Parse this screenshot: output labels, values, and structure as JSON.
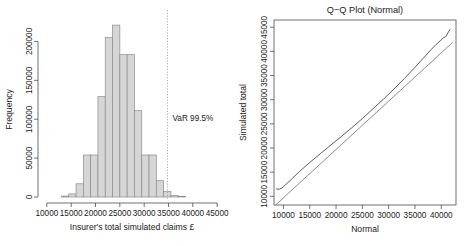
{
  "figure": {
    "background": "#ffffff",
    "panels": [
      "histogram",
      "qq-plot"
    ]
  },
  "chart_data": [
    {
      "type": "bar",
      "id": "histogram",
      "title": "",
      "xlabel": "Insurer's total simulated claims £",
      "ylabel": "Frequency",
      "xlim": [
        9000,
        46000
      ],
      "ylim": [
        0,
        225000
      ],
      "xticks": [
        10000,
        15000,
        20000,
        25000,
        30000,
        35000,
        40000,
        45000
      ],
      "xtick_labels": [
        "10000",
        "15000",
        "20000",
        "25000",
        "30000",
        "35000",
        "40000",
        "45000"
      ],
      "yticks": [
        0,
        50000,
        100000,
        150000,
        200000
      ],
      "ytick_labels": [
        "0",
        "50000",
        "100000",
        "150000",
        "200000"
      ],
      "grid": false,
      "legend": null,
      "bin_width": 1500,
      "bin_starts": [
        13000,
        14500,
        16000,
        17500,
        19000,
        20500,
        22000,
        23500,
        25000,
        26500,
        28000,
        29500,
        31000,
        32500,
        34000,
        35500,
        37000
      ],
      "values": [
        1200,
        4000,
        17000,
        54000,
        54000,
        129000,
        205000,
        221000,
        183000,
        183000,
        111000,
        54000,
        54000,
        21000,
        7000,
        1800,
        600
      ],
      "bars_fill": "#d6d6d6",
      "bars_edge": "#8c8c8c",
      "annotation": {
        "label": "VaR 99.5%",
        "x_value": 34800,
        "line_style": "dotted",
        "line_color": "#9a9a9a"
      }
    },
    {
      "type": "line",
      "id": "qq-plot",
      "title": "Q−Q Plot (Normal)",
      "xlabel": "Normal",
      "ylabel": "Simulated total",
      "xlim": [
        8200,
        42800
      ],
      "ylim": [
        8200,
        46500
      ],
      "xticks": [
        10000,
        15000,
        20000,
        25000,
        30000,
        35000,
        40000
      ],
      "xtick_labels": [
        "10000",
        "15000",
        "20000",
        "25000",
        "30000",
        "35000",
        "40000"
      ],
      "yticks": [
        10000,
        15000,
        20000,
        25000,
        30000,
        35000,
        40000,
        45000
      ],
      "ytick_labels": [
        "10000",
        "15000",
        "20000",
        "25000",
        "30000",
        "35000",
        "40000",
        "45000"
      ],
      "grid": false,
      "legend": null,
      "series": [
        {
          "name": "reference-line",
          "color": "#6e6e6e",
          "x": [
            8600,
            42200
          ],
          "y": [
            8300,
            41900
          ]
        },
        {
          "name": "sample-quantiles",
          "color": "#333333",
          "x": [
            8600,
            8750,
            9000,
            9300,
            9700,
            10500,
            11500,
            13000,
            15000,
            17000,
            19000,
            21000,
            23000,
            25000,
            27000,
            29000,
            31000,
            33000,
            35000,
            36500,
            38000,
            39000,
            39800,
            40400,
            40900,
            41300,
            41700
          ],
          "y": [
            11600,
            11500,
            11450,
            11500,
            11700,
            12500,
            13500,
            15100,
            17000,
            18800,
            20600,
            22400,
            24200,
            26100,
            28100,
            30100,
            32200,
            34400,
            36700,
            38500,
            40300,
            41400,
            42200,
            42800,
            43100,
            43900,
            44600
          ]
        }
      ]
    }
  ]
}
